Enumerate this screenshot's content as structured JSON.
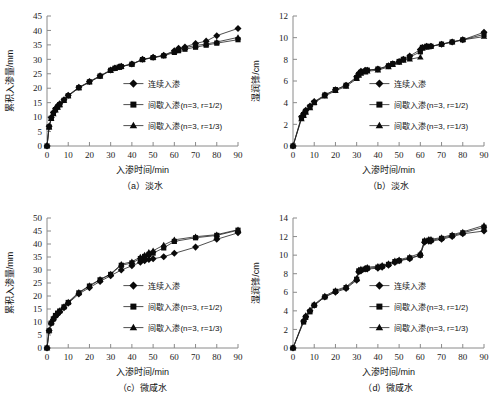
{
  "figure": {
    "panels": [
      "a",
      "b",
      "c",
      "d"
    ]
  },
  "chart_data": [
    {
      "id": "a",
      "type": "line",
      "title": "",
      "caption": "（a）淡水",
      "xlabel": "入渗时间/min",
      "ylabel": "累积入渗量/mm",
      "xlim": [
        0,
        90
      ],
      "ylim": [
        0,
        45
      ],
      "xticks": [
        0,
        10,
        20,
        30,
        40,
        50,
        60,
        70,
        80,
        90
      ],
      "yticks": [
        0,
        5,
        10,
        15,
        20,
        25,
        30,
        35,
        40,
        45
      ],
      "grid": false,
      "legend_position": "center-right",
      "series": [
        {
          "name": "连续入渗",
          "marker": "diamond",
          "x": [
            0,
            1,
            2,
            3,
            4,
            5,
            6,
            8,
            10,
            15,
            20,
            25,
            30,
            32,
            34,
            35,
            40,
            45,
            50,
            55,
            60,
            62,
            65,
            70,
            75,
            80,
            90
          ],
          "values": [
            0,
            6.8,
            9.9,
            11.6,
            12.9,
            13.8,
            14.6,
            16.0,
            17.6,
            20.3,
            22.3,
            24.3,
            26.3,
            27.0,
            27.4,
            27.6,
            28.4,
            30.0,
            30.7,
            31.4,
            33.0,
            33.8,
            34.3,
            35.5,
            36.3,
            38.2,
            40.7
          ]
        },
        {
          "name": "间歇入渗(n=3, r=1/2)",
          "marker": "square",
          "x": [
            0,
            1,
            2,
            3,
            4,
            5,
            6,
            8,
            10,
            15,
            20,
            25,
            30,
            32,
            34,
            35,
            40,
            45,
            50,
            55,
            60,
            62,
            65,
            70,
            75,
            80,
            90
          ],
          "values": [
            0,
            6.6,
            9.6,
            11.3,
            12.6,
            13.5,
            14.3,
            15.8,
            17.4,
            20.2,
            22.2,
            24.2,
            26.2,
            26.9,
            27.3,
            27.5,
            28.3,
            29.9,
            30.6,
            31.2,
            32.4,
            33.0,
            33.5,
            34.2,
            34.9,
            35.6,
            36.8
          ]
        },
        {
          "name": "间歇入渗(n=3, r=1/3)",
          "marker": "triangle",
          "x": [
            0,
            1,
            2,
            3,
            4,
            5,
            6,
            8,
            10,
            15,
            20,
            25,
            30,
            32,
            34,
            35,
            40,
            45,
            50,
            55,
            60,
            62,
            65,
            70,
            75,
            80,
            90
          ],
          "values": [
            0,
            6.5,
            9.4,
            11.1,
            12.4,
            13.3,
            14.2,
            15.7,
            17.3,
            20.1,
            22.1,
            24.1,
            26.1,
            26.8,
            27.2,
            27.5,
            28.3,
            29.9,
            30.6,
            31.3,
            32.8,
            33.4,
            34.0,
            34.8,
            35.3,
            36.0,
            37.6
          ]
        }
      ]
    },
    {
      "id": "b",
      "type": "line",
      "title": "",
      "caption": "（b）淡水",
      "xlabel": "入渗时间/min",
      "ylabel": "湿润锋/cm",
      "xlim": [
        0,
        90
      ],
      "ylim": [
        0,
        12
      ],
      "xticks": [
        0,
        10,
        20,
        30,
        40,
        50,
        60,
        70,
        80,
        90
      ],
      "yticks": [
        0,
        2,
        4,
        6,
        8,
        10,
        12
      ],
      "grid": false,
      "legend_position": "center-right",
      "series": [
        {
          "name": "连续入渗",
          "marker": "diamond",
          "x": [
            0,
            4,
            5,
            6,
            8,
            10,
            15,
            20,
            25,
            30,
            31,
            32,
            34,
            35,
            40,
            45,
            47,
            50,
            52,
            55,
            60,
            61,
            63,
            65,
            70,
            75,
            80,
            90
          ],
          "values": [
            0,
            2.7,
            3.0,
            3.3,
            3.7,
            4.1,
            4.7,
            5.2,
            5.6,
            6.4,
            6.7,
            6.9,
            7.0,
            7.0,
            7.1,
            7.4,
            7.6,
            7.8,
            8.0,
            8.3,
            8.9,
            9.1,
            9.2,
            9.2,
            9.4,
            9.6,
            9.8,
            10.5
          ]
        },
        {
          "name": "间歇入渗(n=3, r=1/2)",
          "marker": "square",
          "x": [
            0,
            4,
            5,
            6,
            8,
            10,
            15,
            20,
            25,
            30,
            31,
            32,
            34,
            35,
            40,
            45,
            47,
            50,
            52,
            55,
            60,
            61,
            63,
            65,
            70,
            75,
            80,
            90
          ],
          "values": [
            0,
            2.6,
            2.9,
            3.2,
            3.6,
            4.0,
            4.7,
            5.2,
            5.6,
            6.3,
            6.6,
            6.8,
            6.9,
            7.0,
            7.1,
            7.4,
            7.6,
            7.8,
            8.0,
            8.2,
            8.7,
            9.1,
            9.2,
            9.2,
            9.4,
            9.6,
            9.8,
            10.3
          ]
        },
        {
          "name": "间歇入渗(n=3, r=1/3)",
          "marker": "triangle",
          "x": [
            0,
            4,
            5,
            6,
            8,
            10,
            15,
            20,
            25,
            30,
            31,
            32,
            34,
            35,
            40,
            45,
            47,
            50,
            52,
            55,
            60,
            61,
            63,
            65,
            70,
            75,
            80,
            90
          ],
          "values": [
            0,
            2.5,
            2.8,
            3.1,
            3.5,
            4.0,
            4.6,
            5.1,
            5.5,
            6.2,
            6.5,
            6.7,
            6.8,
            6.9,
            7.0,
            7.3,
            7.5,
            7.7,
            7.9,
            8.0,
            8.2,
            9.0,
            9.1,
            9.2,
            9.4,
            9.6,
            9.8,
            10.1
          ]
        }
      ]
    },
    {
      "id": "c",
      "type": "line",
      "title": "",
      "caption": "（c）微咸水",
      "xlabel": "入渗时间/min",
      "ylabel": "累积入渗量/mm",
      "xlim": [
        0,
        90
      ],
      "ylim": [
        0,
        50
      ],
      "xticks": [
        0,
        10,
        20,
        30,
        40,
        50,
        60,
        70,
        80,
        90
      ],
      "yticks": [
        0,
        5,
        10,
        15,
        20,
        25,
        30,
        35,
        40,
        45,
        50
      ],
      "grid": false,
      "legend_position": "center-right",
      "series": [
        {
          "name": "连续入渗",
          "marker": "diamond",
          "x": [
            0,
            1,
            2,
            3,
            4,
            5,
            6,
            8,
            10,
            15,
            20,
            25,
            30,
            35,
            40,
            44,
            46,
            48,
            50,
            55,
            60,
            70,
            80,
            90
          ],
          "values": [
            0,
            6.7,
            9.5,
            11.0,
            12.2,
            13.1,
            13.9,
            15.5,
            17.2,
            20.8,
            23.2,
            25.6,
            27.8,
            30.0,
            31.6,
            33.0,
            33.6,
            34.0,
            34.3,
            35.1,
            36.4,
            38.8,
            41.8,
            44.3
          ]
        },
        {
          "name": "间歇入渗(n=3, r=1/2)",
          "marker": "square",
          "x": [
            0,
            1,
            2,
            3,
            4,
            5,
            6,
            8,
            10,
            15,
            20,
            25,
            30,
            35,
            40,
            44,
            46,
            48,
            50,
            55,
            60,
            70,
            80,
            90
          ],
          "values": [
            0,
            6.6,
            9.6,
            11.2,
            12.5,
            13.4,
            14.2,
            15.8,
            17.5,
            21.2,
            23.8,
            26.2,
            28.3,
            31.8,
            32.7,
            34.4,
            35.2,
            36.0,
            36.5,
            38.5,
            41.0,
            42.4,
            43.3,
            45.3
          ]
        },
        {
          "name": "间歇入渗(n=3, r=1/3)",
          "marker": "triangle",
          "x": [
            0,
            1,
            2,
            3,
            4,
            5,
            6,
            8,
            10,
            15,
            20,
            25,
            30,
            35,
            40,
            44,
            46,
            48,
            50,
            55,
            60,
            70,
            80,
            90
          ],
          "values": [
            0,
            6.8,
            9.8,
            11.4,
            12.7,
            13.6,
            14.4,
            16.0,
            17.7,
            21.4,
            24.0,
            26.4,
            28.5,
            32.2,
            33.2,
            35.0,
            35.8,
            36.8,
            37.4,
            39.6,
            41.6,
            42.8,
            43.6,
            45.5
          ]
        }
      ]
    },
    {
      "id": "d",
      "type": "line",
      "title": "",
      "caption": "（d）微咸水",
      "xlabel": "入渗时间/min",
      "ylabel": "湿润锋/cm",
      "xlim": [
        0,
        90
      ],
      "ylim": [
        0,
        14
      ],
      "xticks": [
        0,
        10,
        20,
        30,
        40,
        50,
        60,
        70,
        80,
        90
      ],
      "yticks": [
        0,
        2,
        4,
        6,
        8,
        10,
        12,
        14
      ],
      "grid": false,
      "legend_position": "center-right",
      "series": [
        {
          "name": "连续入渗",
          "marker": "diamond",
          "x": [
            0,
            5,
            6,
            8,
            10,
            15,
            20,
            25,
            30,
            31,
            32,
            34,
            35,
            40,
            42,
            45,
            48,
            50,
            55,
            60,
            62,
            64,
            65,
            70,
            75,
            80,
            90
          ],
          "values": [
            0,
            2.9,
            3.4,
            4.0,
            4.6,
            5.5,
            6.0,
            6.4,
            7.3,
            8.2,
            8.3,
            8.5,
            8.5,
            8.6,
            8.7,
            8.9,
            9.2,
            9.4,
            9.6,
            10.0,
            11.4,
            11.5,
            11.5,
            11.7,
            12.0,
            12.3,
            12.6
          ]
        },
        {
          "name": "间歇入渗(n=3, r=1/2)",
          "marker": "square",
          "x": [
            0,
            5,
            6,
            8,
            10,
            15,
            20,
            25,
            30,
            31,
            32,
            34,
            35,
            40,
            42,
            45,
            48,
            50,
            55,
            60,
            62,
            64,
            65,
            70,
            75,
            80,
            90
          ],
          "values": [
            0,
            2.8,
            3.3,
            3.9,
            4.6,
            5.5,
            6.1,
            6.5,
            7.4,
            8.3,
            8.4,
            8.5,
            8.6,
            8.7,
            8.8,
            9.0,
            9.3,
            9.4,
            9.7,
            10.0,
            11.5,
            11.6,
            11.6,
            11.8,
            12.1,
            12.4,
            13.0
          ]
        },
        {
          "name": "间歇入渗(n=3, r=1/3)",
          "marker": "triangle",
          "x": [
            0,
            5,
            6,
            8,
            10,
            15,
            20,
            25,
            30,
            31,
            32,
            34,
            35,
            40,
            42,
            45,
            48,
            50,
            55,
            60,
            62,
            64,
            65,
            70,
            75,
            80,
            90
          ],
          "values": [
            0,
            3.0,
            3.5,
            4.1,
            4.7,
            5.6,
            6.2,
            6.6,
            7.5,
            8.4,
            8.5,
            8.6,
            8.7,
            8.8,
            8.9,
            9.1,
            9.4,
            9.5,
            9.8,
            10.2,
            11.6,
            11.7,
            11.7,
            11.9,
            12.2,
            12.5,
            13.2
          ]
        }
      ]
    }
  ]
}
